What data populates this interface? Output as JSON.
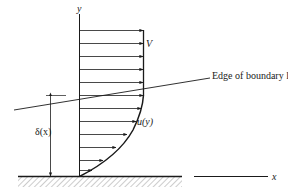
{
  "figure": {
    "labels": {
      "y_axis": "y",
      "x_axis": "x",
      "freestream_velocity": "V",
      "edge_label": "Edge of boundary layer",
      "thickness": "δ(x)",
      "profile": "u(y)"
    },
    "elements": {
      "wall": "Flat plate wall with hatching below",
      "velocity_arrows_uniform": 6,
      "velocity_arrows_profile": 6,
      "edge_line": "Boundary layer edge line, rising left to right",
      "thickness_dimension": "Double-headed vertical arrow δ(x) from wall to edge"
    },
    "colors": {
      "ink": "#1a1a1a",
      "hatch": "#9a9a9a",
      "background": "#ffffff"
    }
  }
}
